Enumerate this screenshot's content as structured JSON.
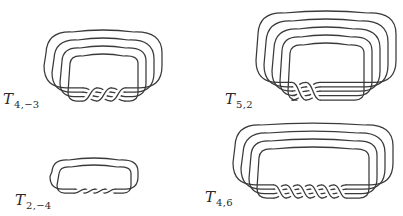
{
  "figure": {
    "stroke_color": "#3a3a3a",
    "background": "#ffffff"
  },
  "knots": [
    {
      "id": "T4m3",
      "label_main": "T",
      "label_sub": "4,−3",
      "p": 4,
      "q": -3,
      "label_pos": {
        "x": 3,
        "y": 92
      },
      "box": {
        "x": 44,
        "y": 31,
        "w": 118,
        "h": 72
      },
      "strands": 4,
      "twist_center_x": 104,
      "twist_count": 3
    },
    {
      "id": "T52",
      "label_main": "T",
      "label_sub": "5,2",
      "p": 5,
      "q": 2,
      "label_pos": {
        "x": 225,
        "y": 92
      },
      "box": {
        "x": 256,
        "y": 12,
        "w": 140,
        "h": 90
      },
      "strands": 5,
      "twist_center_x": 306,
      "twist_count": 2
    },
    {
      "id": "T2m4",
      "label_main": "T",
      "label_sub": "2,−4",
      "p": 2,
      "q": -4,
      "label_pos": {
        "x": 15,
        "y": 193
      },
      "box": {
        "x": 50,
        "y": 159,
        "w": 88,
        "h": 36
      },
      "strands": 2,
      "twist_center_x": 95,
      "twist_count": 4
    },
    {
      "id": "T46",
      "label_main": "T",
      "label_sub": "4,6",
      "p": 4,
      "q": 6,
      "label_pos": {
        "x": 205,
        "y": 190
      },
      "box": {
        "x": 233,
        "y": 124,
        "w": 160,
        "h": 76
      },
      "strands": 4,
      "twist_center_x": 310,
      "twist_count": 6
    }
  ]
}
